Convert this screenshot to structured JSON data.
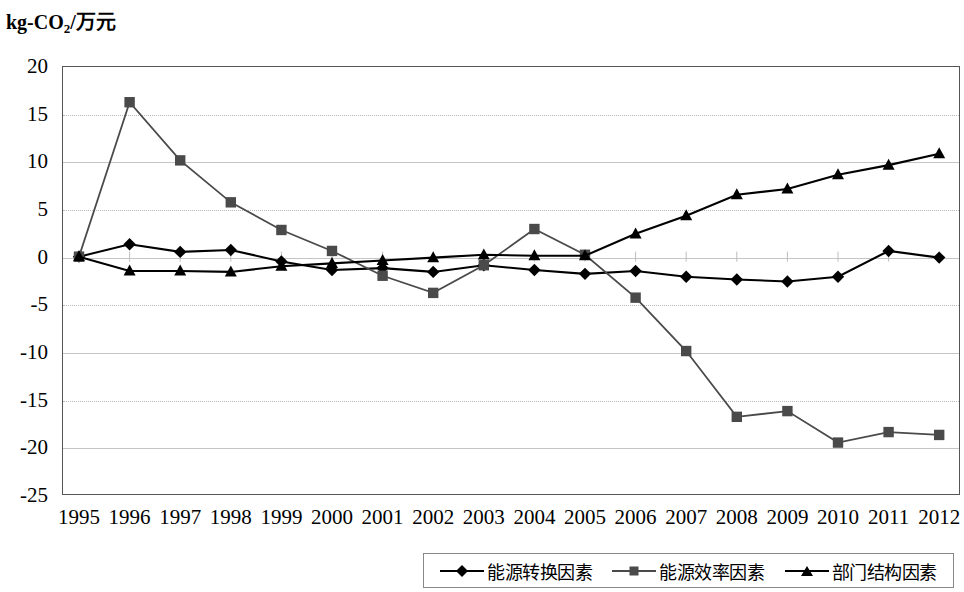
{
  "chart_data": {
    "type": "line",
    "title": "",
    "ylabel": "kg-CO2/万元",
    "ylabel_prefix": "kg-CO",
    "ylabel_sub": "2",
    "ylabel_suffix": "/万元",
    "xlabel": "",
    "ylim": [
      -25,
      20
    ],
    "yticks": [
      20,
      15,
      10,
      5,
      0,
      -5,
      -10,
      -15,
      -20,
      -25
    ],
    "ytick_labels": [
      "20",
      "15",
      "10",
      "5",
      "0",
      "-5",
      "-10",
      "-15",
      "-20",
      "-25"
    ],
    "grid": true,
    "legend_position": "bottom",
    "categories": [
      1995,
      1996,
      1997,
      1998,
      1999,
      2000,
      2001,
      2002,
      2003,
      2004,
      2005,
      2006,
      2007,
      2008,
      2009,
      2010,
      2011,
      2012
    ],
    "category_labels": [
      "1995",
      "1996",
      "1997",
      "1998",
      "1999",
      "2000",
      "2001",
      "2002",
      "2003",
      "2004",
      "2005",
      "2006",
      "2007",
      "2008",
      "2009",
      "2010",
      "2011",
      "2012"
    ],
    "series": [
      {
        "name": "能源转换因素",
        "marker": "diamond",
        "color": "#000000",
        "values": [
          0.0,
          1.3,
          0.5,
          0.7,
          -0.5,
          -1.4,
          -1.2,
          -1.6,
          -0.9,
          -1.4,
          -1.8,
          -1.5,
          -2.1,
          -2.4,
          -2.6,
          -2.1,
          0.6,
          -0.1
        ]
      },
      {
        "name": "能源效率因素",
        "marker": "square",
        "color": "#4a4a4a",
        "values": [
          0.0,
          16.2,
          10.1,
          5.7,
          2.8,
          0.6,
          -2.0,
          -3.8,
          -0.9,
          2.9,
          0.2,
          -4.3,
          -9.9,
          -16.8,
          -16.2,
          -19.5,
          -18.4,
          -18.7
        ]
      },
      {
        "name": "部门结构因素",
        "marker": "triangle",
        "color": "#000000",
        "values": [
          0.0,
          -1.5,
          -1.5,
          -1.6,
          -1.0,
          -0.7,
          -0.4,
          -0.1,
          0.2,
          0.1,
          0.1,
          2.4,
          4.3,
          6.5,
          7.1,
          8.6,
          9.6,
          10.8
        ]
      }
    ]
  },
  "legend": {
    "items": [
      {
        "label": "能源转换因素",
        "marker": "diamond"
      },
      {
        "label": "能源效率因素",
        "marker": "square"
      },
      {
        "label": "部门结构因素",
        "marker": "triangle"
      }
    ]
  }
}
